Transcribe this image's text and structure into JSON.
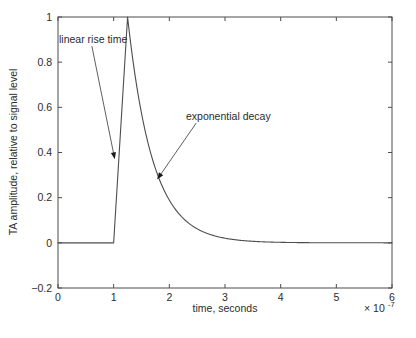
{
  "chart_data": {
    "type": "line",
    "title": "",
    "xlabel": "time, seconds",
    "ylabel": "TA amplitude, relative to signal level",
    "x_exponent_label": "× 10",
    "x_exponent_power": "-7",
    "xlim": [
      0,
      6
    ],
    "ylim": [
      -0.2,
      1.0
    ],
    "xticks": [
      0,
      1,
      2,
      3,
      4,
      5,
      6
    ],
    "xtick_labels": [
      "0",
      "1",
      "2",
      "3",
      "4",
      "5",
      "6"
    ],
    "yticks": [
      -0.2,
      0,
      0.2,
      0.4,
      0.6,
      0.8,
      1
    ],
    "ytick_labels": [
      "−0.2",
      "0",
      "0.2",
      "0.4",
      "0.6",
      "0.8",
      "1"
    ],
    "grid": false,
    "legend": "none",
    "line_color": "#4d4d4d",
    "axis_color": "#4d4d4d",
    "series": [
      {
        "name": "TA signal",
        "description": "flat baseline at 0 until t=1.0e-7, linear rise to peak 1.0 at t=1.25e-7, then exponential decay back to 0",
        "baseline_value": 0,
        "rise_start_x": 1.0,
        "peak_x": 1.25,
        "peak_y": 1.0,
        "decay_time_constant_x": 0.45,
        "end_x": 6.0,
        "end_y": 0.0
      }
    ],
    "annotations": [
      {
        "text": "linear rise time",
        "label_x": 0.98,
        "label_y": 1.11,
        "arrow_tip_x": 1.02,
        "arrow_tip_y": 0.37
      },
      {
        "text": "exponential decay",
        "label_x": 3.23,
        "label_y": 0.68,
        "arrow_tip_x": 1.78,
        "arrow_tip_y": 0.28
      }
    ]
  }
}
